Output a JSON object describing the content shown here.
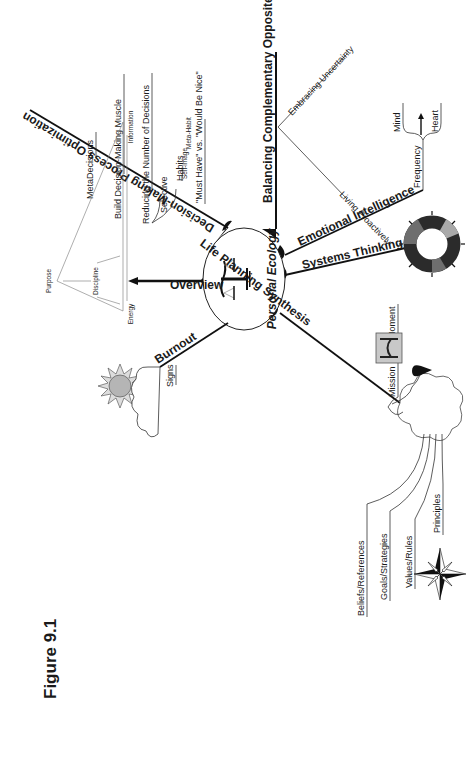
{
  "figure": {
    "title": "Figure 9.1",
    "center": "Personal Ecology",
    "center_icon": "scales-of-justice-icon"
  },
  "branches": {
    "decision_making": {
      "label": "Decision-Making Process Optimization",
      "items": [
        "MetaDecisions",
        "Build Decision-Making Muscle",
        "Reducing the Number of Decisions",
        "Selective",
        "Habits",
        "Self-image",
        "Meta-Habit",
        "\"Must Have\" vs. \"Would Be Nice\""
      ]
    },
    "balancing": {
      "label": "Balancing Complementary Opposites",
      "items": [
        "Embracing Uncertainty",
        "Living Proactively"
      ]
    },
    "emotional": {
      "label": "Emotional Intelligence",
      "items": [
        "Frequency",
        "Mind",
        "Heart"
      ]
    },
    "systems": {
      "label": "Systems Thinking",
      "icon": "cycle-ring-icon"
    },
    "life_planning": {
      "label": "Life Planning Synthesis",
      "items": [
        "Mission",
        "Moment",
        "Beliefs/References",
        "Goals/Strategies",
        "Values/Rules",
        "Principles"
      ],
      "compass_letter": "N"
    },
    "burnout": {
      "label": "Burnout",
      "items": [
        "Signs"
      ]
    },
    "overview": {
      "label": "Overview",
      "triangle": [
        "Purpose",
        "Discipline",
        "Energy",
        "Information"
      ]
    }
  },
  "colors": {
    "ink": "#1a1a1a",
    "sun_fill": "#b5b5b5",
    "ring_dark": "#2b2b2b",
    "ring_mid": "#6e6e6e",
    "ring_light": "#a9a9a9",
    "box_fill": "#c8c8c8"
  }
}
